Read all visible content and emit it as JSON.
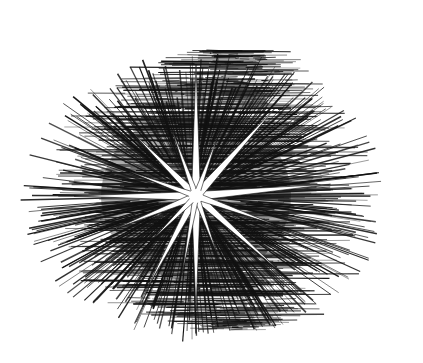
{
  "image": {
    "description": "Black and white engraving of a multi-pointed white star burst radiating over dense black hatched lines",
    "background_color": "#ffffff",
    "ink_color": "#111111",
    "star_color": "#ffffff",
    "center": [
      196,
      196
    ],
    "rays": [
      {
        "angle": -90,
        "length": 132,
        "width": 9
      },
      {
        "angle": 90,
        "length": 115,
        "width": 9
      },
      {
        "angle": 180,
        "length": 122,
        "width": 9
      },
      {
        "angle": -5,
        "length": 135,
        "width": 9
      },
      {
        "angle": -135,
        "length": 88,
        "width": 8
      },
      {
        "angle": -48,
        "length": 118,
        "width": 9
      },
      {
        "angle": 118,
        "length": 105,
        "width": 8
      },
      {
        "angle": 42,
        "length": 112,
        "width": 8
      },
      {
        "angle": -110,
        "length": 70,
        "width": 6
      },
      {
        "angle": -70,
        "length": 62,
        "width": 6
      },
      {
        "angle": 158,
        "length": 88,
        "width": 7
      },
      {
        "angle": 20,
        "length": 85,
        "width": 7
      },
      {
        "angle": 70,
        "length": 60,
        "width": 6
      },
      {
        "angle": 100,
        "length": 78,
        "width": 6
      },
      {
        "angle": -160,
        "length": 72,
        "width": 6
      },
      {
        "angle": 135,
        "length": 60,
        "width": 6
      }
    ],
    "hatch_region": {
      "cx": 205,
      "cy": 190,
      "rx": 175,
      "ry": 140
    }
  }
}
